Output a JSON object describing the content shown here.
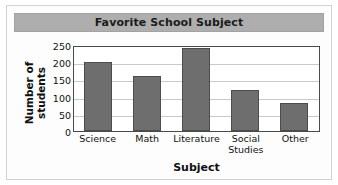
{
  "chart_data": {
    "type": "bar",
    "title": "Favorite School Subject",
    "xlabel": "Subject",
    "ylabel": "Number of students",
    "categories": [
      "Science",
      "Math",
      "Literature",
      "Social Studies",
      "Other"
    ],
    "values": [
      200,
      160,
      240,
      120,
      80
    ],
    "ylim": [
      0,
      250
    ],
    "yticks": [
      0,
      50,
      100,
      150,
      200,
      250
    ],
    "ytick_labels": [
      "0",
      "50",
      "100",
      "150",
      "200",
      "250"
    ],
    "grid": "horizontal",
    "legend": "none",
    "bar_color": "#6e6e6e",
    "bar_edge_color": "#4d4d4d",
    "title_band_color": "#aeaeae",
    "plot_background": "#ffffff",
    "gridline_color": "#c9c9c9",
    "axis_color": "#4a4a4a"
  },
  "figure": {
    "title_text": "Favorite School Subject",
    "y_axis_title_line1": "Number of",
    "y_axis_title_line2": "students",
    "x_axis_title": "Subject"
  }
}
